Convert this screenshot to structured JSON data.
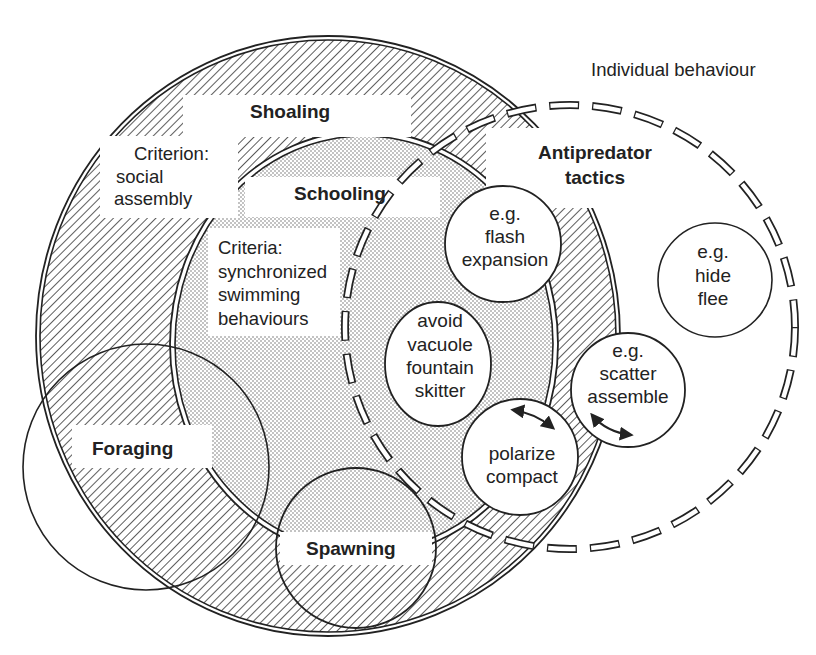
{
  "title": "Individual behaviour",
  "colors": {
    "ink": "#222222",
    "background": "#ffffff",
    "hatch": "#333333",
    "dots": "#6a6a6a"
  },
  "sets": {
    "shoaling": {
      "label": "Shoaling",
      "criterion_lines": [
        "Criterion:",
        "social",
        "assembly"
      ],
      "fill": "diagonal-hatch"
    },
    "schooling": {
      "label": "Schooling",
      "criteria_lines": [
        "Criteria:",
        "synchronized",
        "swimming",
        "behaviours"
      ],
      "fill": "stipple-dots"
    },
    "antipredator": {
      "label_lines": [
        "Antipredator",
        "tactics"
      ],
      "border": "dashed"
    },
    "foraging": {
      "label": "Foraging"
    },
    "spawning": {
      "label": "Spawning"
    }
  },
  "behaviours": [
    {
      "id": "flash",
      "lines": [
        "e.g.",
        "flash",
        "expansion"
      ]
    },
    {
      "id": "avoid",
      "lines": [
        "avoid",
        "vacuole",
        "fountain",
        "skitter"
      ]
    },
    {
      "id": "hide",
      "lines": [
        "e.g.",
        "hide",
        "flee"
      ]
    },
    {
      "id": "scatter",
      "lines": [
        "e.g.",
        "scatter",
        "assemble"
      ]
    },
    {
      "id": "polarize",
      "lines": [
        "polarize",
        "compact"
      ]
    }
  ],
  "arrows": [
    {
      "name": "polarize-scatter-transition-arrow-left",
      "type": "double-headed"
    },
    {
      "name": "polarize-scatter-transition-arrow-right",
      "type": "double-headed"
    }
  ]
}
